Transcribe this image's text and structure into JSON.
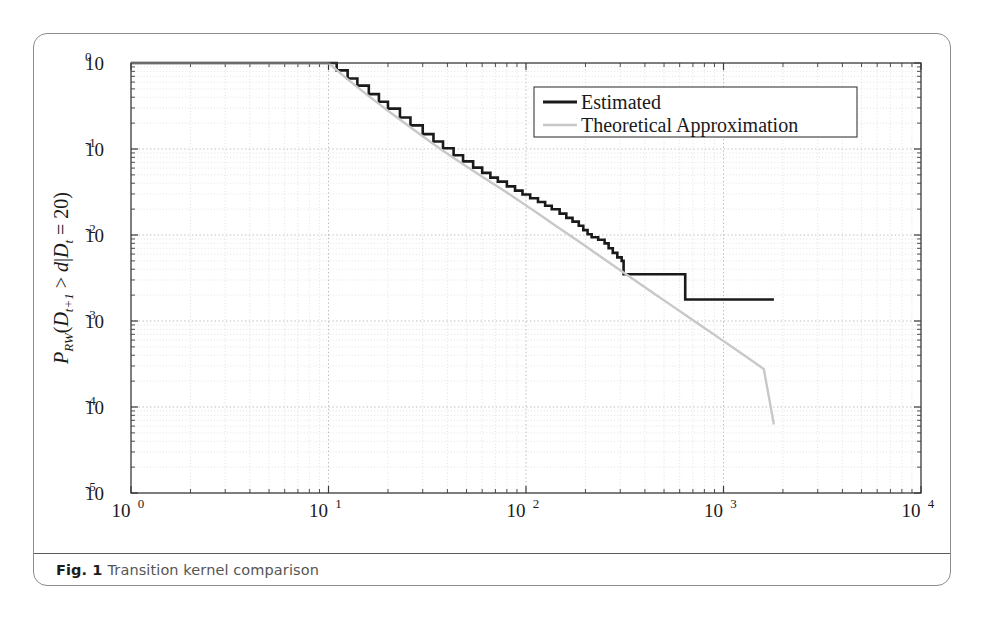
{
  "caption": {
    "label": "Fig. 1",
    "text": "Transition kernel comparison"
  },
  "colors": {
    "estimated": "#1a1a1a",
    "theoretical": "#c8c8c8",
    "axis": "#3a3a3a",
    "grid_major": "#b4b4b4",
    "grid_minor": "#d8d8d8",
    "card_border": "#8c8c8c",
    "background": "#ffffff"
  },
  "chart_data": {
    "type": "line",
    "title": "",
    "xlabel": "Degree, d",
    "ylabel": "P_RW(D_{t+1} > d | D_t = 20)",
    "xscale": "log",
    "yscale": "log",
    "xlim": [
      1,
      10000
    ],
    "ylim": [
      1e-05,
      1
    ],
    "grid": true,
    "legend_position": "top-right",
    "xticks": [
      1,
      10,
      100,
      1000,
      10000
    ],
    "xtick_labels": [
      "10^0",
      "10^1",
      "10^2",
      "10^3",
      "10^4"
    ],
    "yticks": [
      1,
      0.1,
      0.01,
      0.001,
      0.0001,
      1e-05
    ],
    "ytick_labels": [
      "10^0",
      "10^-1",
      "10^-2",
      "10^-3",
      "10^-4",
      "10^-5"
    ],
    "series": [
      {
        "name": "Estimated",
        "color": "#1a1a1a",
        "width": 2.6,
        "style": "step",
        "points": [
          [
            1.0,
            1.0
          ],
          [
            10.0,
            1.0
          ],
          [
            11.0,
            0.82
          ],
          [
            12.5,
            0.66
          ],
          [
            14.0,
            0.545
          ],
          [
            16.0,
            0.435
          ],
          [
            18.0,
            0.355
          ],
          [
            20.0,
            0.295
          ],
          [
            23.0,
            0.232
          ],
          [
            26.0,
            0.188
          ],
          [
            30.0,
            0.149
          ],
          [
            34.0,
            0.122
          ],
          [
            38.0,
            0.102
          ],
          [
            43.0,
            0.0845
          ],
          [
            48.0,
            0.0718
          ],
          [
            54.0,
            0.0608
          ],
          [
            60.0,
            0.0528
          ],
          [
            66.0,
            0.0465
          ],
          [
            72.0,
            0.0418
          ],
          [
            80.0,
            0.0368
          ],
          [
            88.0,
            0.0328
          ],
          [
            96.0,
            0.0296
          ],
          [
            105.0,
            0.0268
          ],
          [
            115.0,
            0.0242
          ],
          [
            125.0,
            0.0219
          ],
          [
            135.0,
            0.0199
          ],
          [
            148.0,
            0.0177
          ],
          [
            160.0,
            0.0158
          ],
          [
            172.0,
            0.0143
          ],
          [
            185.0,
            0.0128
          ],
          [
            195.0,
            0.0114
          ],
          [
            205.0,
            0.0102
          ],
          [
            215.0,
            0.0094
          ],
          [
            232.0,
            0.0088
          ],
          [
            250.0,
            0.008
          ],
          [
            262.0,
            0.007
          ],
          [
            275.0,
            0.0062
          ],
          [
            290.0,
            0.0055
          ],
          [
            305.0,
            0.005
          ],
          [
            312.0,
            0.0035
          ],
          [
            620.0,
            0.0035
          ],
          [
            640.0,
            0.00178
          ],
          [
            1800.0,
            0.00178
          ]
        ]
      },
      {
        "name": "Theoretical Approximation",
        "color": "#c8c8c8",
        "width": 2.4,
        "style": "smooth",
        "points": [
          [
            1.0,
            1.0
          ],
          [
            10.0,
            1.0
          ],
          [
            12.0,
            0.7
          ],
          [
            14.0,
            0.525
          ],
          [
            16.0,
            0.412
          ],
          [
            18.0,
            0.335
          ],
          [
            20.0,
            0.278
          ],
          [
            24.0,
            0.205
          ],
          [
            28.0,
            0.158
          ],
          [
            33.0,
            0.12
          ],
          [
            38.0,
            0.0955
          ],
          [
            45.0,
            0.0735
          ],
          [
            53.0,
            0.0575
          ],
          [
            62.0,
            0.0455
          ],
          [
            72.0,
            0.0365
          ],
          [
            85.0,
            0.0285
          ],
          [
            100.0,
            0.0221
          ],
          [
            120.0,
            0.0166
          ],
          [
            140.0,
            0.013
          ],
          [
            165.0,
            0.0101
          ],
          [
            195.0,
            0.00775
          ],
          [
            230.0,
            0.00595
          ],
          [
            270.0,
            0.0046
          ],
          [
            320.0,
            0.00352
          ],
          [
            380.0,
            0.00268
          ],
          [
            450.0,
            0.00205
          ],
          [
            540.0,
            0.00154
          ],
          [
            650.0,
            0.00115
          ],
          [
            780.0,
            0.000865
          ],
          [
            940.0,
            0.000645
          ],
          [
            1130.0,
            0.000482
          ],
          [
            1360.0,
            0.00036
          ],
          [
            1600.0,
            0.000276
          ],
          [
            1800.0,
            6.25e-05
          ]
        ]
      }
    ],
    "legend": [
      {
        "label": "Estimated",
        "color": "#1a1a1a"
      },
      {
        "label": "Theoretical Approximation",
        "color": "#c8c8c8"
      }
    ]
  }
}
